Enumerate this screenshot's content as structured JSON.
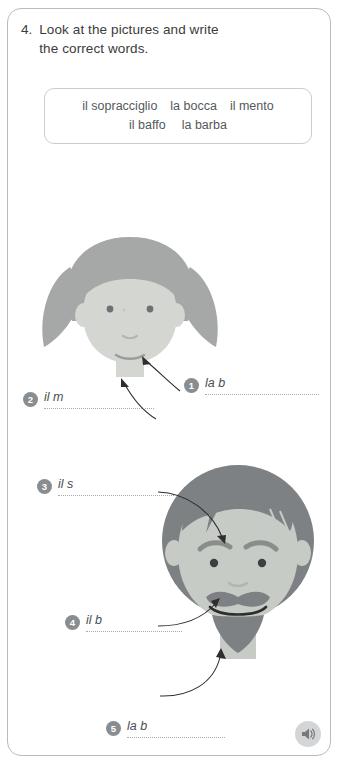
{
  "exercise": {
    "number": "4.",
    "instruction_line_1": "Look at the pictures and write",
    "instruction_line_2": "the correct words."
  },
  "word_bank": {
    "row_1": [
      "il sopracciglio",
      "la bocca",
      "il mento"
    ],
    "row_2": [
      "il baffo",
      "la barba"
    ]
  },
  "answers": [
    {
      "number": "1",
      "prompt": "la b"
    },
    {
      "number": "2",
      "prompt": "il m"
    },
    {
      "number": "3",
      "prompt": "il s"
    },
    {
      "number": "4",
      "prompt": "il b"
    },
    {
      "number": "5",
      "prompt": "la b"
    }
  ],
  "illustrations": {
    "girl": {
      "name": "girl-face",
      "hair_color": "#a6a8a8",
      "skin_color": "#d4d6d2",
      "feature_color": "#b9bbb8",
      "eye_color": "#6e7173"
    },
    "man": {
      "name": "man-face",
      "hair_color": "#7e8183",
      "skin_color": "#c7cbc6",
      "feature_color": "#8a8d8b",
      "eye_color": "#3d4042"
    }
  },
  "audio": {
    "icon": "speaker-icon",
    "color": "#8e9194"
  },
  "colors": {
    "page_border": "#b9bcbe",
    "text": "#3b3b3b",
    "badge": "#8a8d90",
    "dotline": "#a7abae",
    "arrow": "#2e2e2e"
  }
}
